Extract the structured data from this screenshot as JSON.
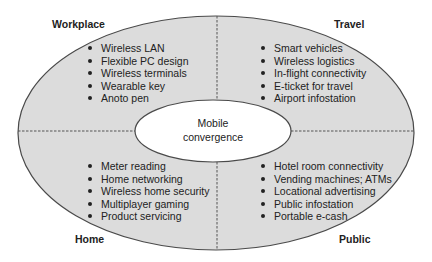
{
  "colors": {
    "background": "#ffffff",
    "ring_fill": "#dcdcdc",
    "center_fill": "#ffffff",
    "stroke": "#4a4a4a",
    "divider": "#555555",
    "text": "#222222"
  },
  "center": {
    "line1": "Mobile",
    "line2": "convergence"
  },
  "quadrants": {
    "workplace": {
      "label": "Workplace",
      "items": [
        "Wireless LAN",
        "Flexible PC design",
        "Wireless terminals",
        "Wearable key",
        "Anoto pen"
      ]
    },
    "travel": {
      "label": "Travel",
      "items": [
        "Smart vehicles",
        "Wireless logistics",
        "In-flight connectivity",
        "E-ticket for travel",
        "Airport infostation"
      ]
    },
    "home": {
      "label": "Home",
      "items": [
        "Meter reading",
        "Home networking",
        "Wireless home security",
        "Multiplayer gaming",
        "Product servicing"
      ]
    },
    "public": {
      "label": "Public",
      "items": [
        "Hotel room connectivity",
        "Vending machines; ATMs",
        "Locational advertising",
        "Public infostation",
        "Portable e-cash"
      ]
    }
  }
}
